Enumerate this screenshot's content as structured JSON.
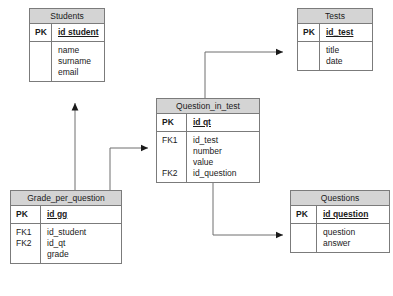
{
  "diagram": {
    "header_color": "#d4d4d4",
    "border_color": "#7b7b7b",
    "text_color": "#1a1a1a"
  },
  "entities": {
    "students": {
      "name": "Students",
      "pk_label": "PK",
      "pk_field": "id student",
      "attributes": [
        "name",
        "surname",
        "email"
      ]
    },
    "tests": {
      "name": "Tests",
      "pk_label": "PK",
      "pk_field": "id_test",
      "attributes": [
        "title",
        "date"
      ]
    },
    "question_in_test": {
      "name": "Question_in_test",
      "pk_label": "PK",
      "pk_field": "id qt",
      "fk1_label": "FK1",
      "fk2_label": "FK2",
      "fk1_fields": [
        "id_test",
        "number",
        "value"
      ],
      "fk2_fields": [
        "id_question"
      ]
    },
    "grade_per_question": {
      "name": "Grade_per_question",
      "pk_label": "PK",
      "pk_field": "id gg",
      "fk1_label": "FK1",
      "fk2_label": "FK2",
      "fk_fields": [
        "id_student",
        "id_qt",
        "grade"
      ]
    },
    "questions": {
      "name": "Questions",
      "pk_label": "PK",
      "pk_field": "id question",
      "attributes": [
        "question",
        "answer"
      ]
    }
  },
  "relationships": [
    {
      "name": "grade-to-students",
      "from": "grade_per_question",
      "to": "students",
      "via_field": "id_student"
    },
    {
      "name": "grade-to-question-in-test",
      "from": "grade_per_question",
      "to": "question_in_test",
      "via_field": "id_qt"
    },
    {
      "name": "question-in-test-to-tests",
      "from": "question_in_test",
      "to": "tests",
      "via_field": "id_test"
    },
    {
      "name": "question-in-test-to-questions",
      "from": "question_in_test",
      "to": "questions",
      "via_field": "id_question"
    }
  ]
}
